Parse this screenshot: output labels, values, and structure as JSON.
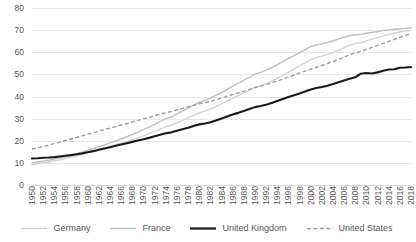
{
  "chart_data": {
    "type": "line",
    "title": "",
    "xlabel": "",
    "ylabel": "",
    "ylim": [
      0,
      80
    ],
    "xlim": [
      1950,
      2018
    ],
    "grid": true,
    "legend_position": "bottom",
    "y_ticks": [
      "0",
      "10",
      "20",
      "30",
      "40",
      "50",
      "60",
      "70",
      "80"
    ],
    "x_ticks": [
      "1950",
      "1952",
      "1954",
      "1956",
      "1958",
      "1960",
      "1962",
      "1964",
      "1966",
      "1968",
      "1970",
      "1972",
      "1974",
      "1976",
      "1978",
      "1980",
      "1982",
      "1984",
      "1986",
      "1988",
      "1990",
      "1992",
      "1994",
      "1996",
      "1998",
      "2000",
      "2002",
      "2004",
      "2006",
      "2008",
      "2010",
      "2012",
      "2014",
      "2016",
      "2018"
    ],
    "x": [
      1950,
      1951,
      1952,
      1953,
      1954,
      1955,
      1956,
      1957,
      1958,
      1959,
      1960,
      1961,
      1962,
      1963,
      1964,
      1965,
      1966,
      1967,
      1968,
      1969,
      1970,
      1971,
      1972,
      1973,
      1974,
      1975,
      1976,
      1977,
      1978,
      1979,
      1980,
      1981,
      1982,
      1983,
      1984,
      1985,
      1986,
      1987,
      1988,
      1989,
      1990,
      1991,
      1992,
      1993,
      1994,
      1995,
      1996,
      1997,
      1998,
      1999,
      2000,
      2001,
      2002,
      2003,
      2004,
      2005,
      2006,
      2007,
      2008,
      2009,
      2010,
      2011,
      2012,
      2013,
      2014,
      2015,
      2016,
      2017,
      2018
    ],
    "series": [
      {
        "name": "Germany",
        "color": "#d4d4d4",
        "style": "solid",
        "values": [
          9.2,
          9.6,
          10.0,
          10.4,
          10.9,
          11.4,
          12.0,
          12.6,
          13.2,
          13.9,
          14.6,
          15.3,
          16.0,
          16.7,
          17.4,
          18.1,
          18.9,
          19.6,
          20.4,
          21.3,
          22.2,
          23.2,
          24.2,
          25.3,
          26.4,
          27.0,
          28.1,
          29.2,
          30.3,
          31.5,
          32.6,
          33.4,
          34.3,
          35.4,
          36.6,
          37.9,
          39.2,
          40.4,
          41.6,
          42.9,
          44.2,
          44.9,
          45.8,
          46.9,
          48.2,
          49.6,
          51.0,
          52.4,
          53.8,
          55.2,
          56.7,
          57.6,
          58.2,
          58.9,
          59.8,
          60.9,
          62.1,
          63.2,
          64.0,
          64.3,
          65.1,
          65.9,
          66.6,
          67.3,
          68.0,
          68.6,
          69.2,
          69.6,
          69.9
        ]
      },
      {
        "name": "France",
        "color": "#bfbfbf",
        "style": "solid",
        "values": [
          10.0,
          10.4,
          10.8,
          11.2,
          11.7,
          12.3,
          12.9,
          13.5,
          14.2,
          14.9,
          15.7,
          16.5,
          17.3,
          18.1,
          19.0,
          19.9,
          20.8,
          21.8,
          22.8,
          23.9,
          25.0,
          26.2,
          27.4,
          28.7,
          30.0,
          30.8,
          32.1,
          33.4,
          34.7,
          36.1,
          37.3,
          38.2,
          39.3,
          40.5,
          41.8,
          43.2,
          44.7,
          46.0,
          47.3,
          48.7,
          50.1,
          50.9,
          51.9,
          53.1,
          54.4,
          55.8,
          57.2,
          58.5,
          59.8,
          61.2,
          62.6,
          63.3,
          63.8,
          64.4,
          65.1,
          65.9,
          66.8,
          67.5,
          67.9,
          68.1,
          68.6,
          69.0,
          69.4,
          69.8,
          70.1,
          70.4,
          70.6,
          70.8,
          70.9
        ]
      },
      {
        "name": "United Kingdom",
        "color": "#1a1a1a",
        "style": "solid",
        "values": [
          12.0,
          12.1,
          12.3,
          12.4,
          12.6,
          12.9,
          13.2,
          13.5,
          13.9,
          14.3,
          14.8,
          15.3,
          15.9,
          16.5,
          17.1,
          17.7,
          18.3,
          18.9,
          19.5,
          20.1,
          20.7,
          21.3,
          22.0,
          22.7,
          23.4,
          23.8,
          24.5,
          25.2,
          25.9,
          26.7,
          27.4,
          27.8,
          28.4,
          29.2,
          30.1,
          31.0,
          31.9,
          32.6,
          33.4,
          34.3,
          35.2,
          35.7,
          36.3,
          37.1,
          38.0,
          38.9,
          39.8,
          40.6,
          41.4,
          42.3,
          43.2,
          43.8,
          44.3,
          44.9,
          45.6,
          46.4,
          47.2,
          48.0,
          48.7,
          50.3,
          50.6,
          50.4,
          50.9,
          51.6,
          52.2,
          52.3,
          53.0,
          53.1,
          53.3
        ]
      },
      {
        "name": "United States",
        "color": "#9e9e9e",
        "style": "dashed",
        "values": [
          16.2,
          16.8,
          17.4,
          18.0,
          18.7,
          19.4,
          20.1,
          20.8,
          21.5,
          22.2,
          22.9,
          23.6,
          24.3,
          25.0,
          25.7,
          26.4,
          27.1,
          27.8,
          28.5,
          29.2,
          29.9,
          30.6,
          31.3,
          32.0,
          32.7,
          33.2,
          33.9,
          34.6,
          35.3,
          36.0,
          36.7,
          37.2,
          37.8,
          38.5,
          39.3,
          40.1,
          40.9,
          41.6,
          42.4,
          43.2,
          44.0,
          44.6,
          45.3,
          46.1,
          47.0,
          47.9,
          48.8,
          49.7,
          50.6,
          51.5,
          52.4,
          53.2,
          54.0,
          54.9,
          55.8,
          56.8,
          57.8,
          58.8,
          59.7,
          60.4,
          61.3,
          62.2,
          63.1,
          64.0,
          64.9,
          65.8,
          66.7,
          67.6,
          68.4
        ]
      }
    ]
  },
  "legend": {
    "items": [
      {
        "label": "Germany",
        "key": "germany"
      },
      {
        "label": "France",
        "key": "france"
      },
      {
        "label": "United Kingdom",
        "key": "uk"
      },
      {
        "label": "United States",
        "key": "us"
      }
    ]
  }
}
